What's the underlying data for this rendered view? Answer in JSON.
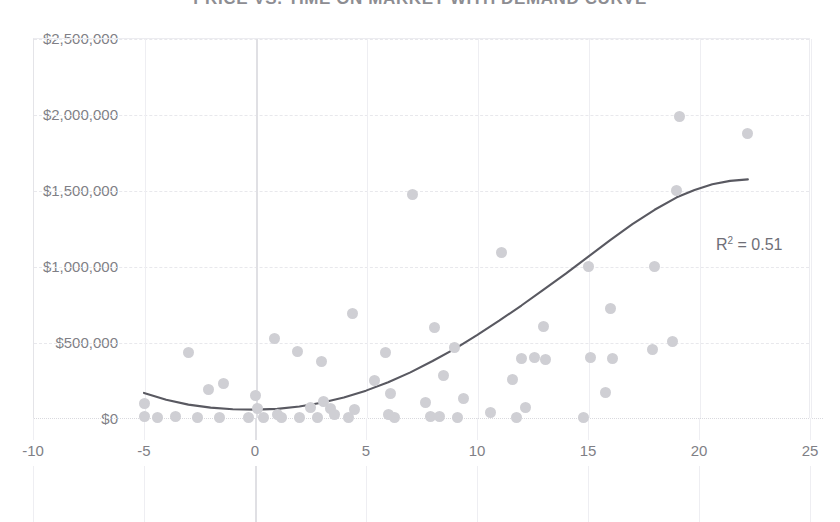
{
  "chart_data": {
    "type": "scatter",
    "title": "PRICE VS. TIME ON MARKET WITH DEMAND CURVE",
    "xlabel": "",
    "ylabel": "",
    "xlim": [
      -10,
      25
    ],
    "ylim": [
      0,
      2500000
    ],
    "x_ticks": [
      "-10",
      "-5",
      "0",
      "5",
      "10",
      "15",
      "20",
      "25"
    ],
    "x_tick_values": [
      -10,
      -5,
      0,
      5,
      10,
      15,
      20,
      25
    ],
    "y_ticks": [
      "$0",
      "$500,000",
      "$1,000,000",
      "$1,500,000",
      "$2,000,000",
      "$2,500,000"
    ],
    "y_tick_values": [
      0,
      500000,
      1000000,
      1500000,
      2000000,
      2500000
    ],
    "grid": true,
    "legend": false,
    "point_color": "#cfcfd4",
    "trendline_color": "#595961",
    "label_color": "#7f7f86",
    "gridline_color": "#e8e8ec",
    "background_color": "#ffffff",
    "annotations": [
      {
        "name": "r-squared",
        "text": "R² = 0.51",
        "value": 0.51,
        "x": 20.8,
        "y": 1120000
      }
    ],
    "points": [
      {
        "x": -5.0,
        "y": 95000
      },
      {
        "x": -5.0,
        "y": 10000
      },
      {
        "x": -4.4,
        "y": 5000
      },
      {
        "x": -3.6,
        "y": 10000
      },
      {
        "x": -3.0,
        "y": 430000
      },
      {
        "x": -2.6,
        "y": 5000
      },
      {
        "x": -2.1,
        "y": 185000
      },
      {
        "x": -1.6,
        "y": 5000
      },
      {
        "x": -1.4,
        "y": 225000
      },
      {
        "x": -0.3,
        "y": 5000
      },
      {
        "x": 0.0,
        "y": 150000
      },
      {
        "x": 0.1,
        "y": 60000
      },
      {
        "x": 0.4,
        "y": 5000
      },
      {
        "x": 0.9,
        "y": 525000
      },
      {
        "x": 1.0,
        "y": 20000
      },
      {
        "x": 1.2,
        "y": 5000
      },
      {
        "x": 1.9,
        "y": 435000
      },
      {
        "x": 2.0,
        "y": 5000
      },
      {
        "x": 2.5,
        "y": 70000
      },
      {
        "x": 2.8,
        "y": 5000
      },
      {
        "x": 3.0,
        "y": 370000
      },
      {
        "x": 3.1,
        "y": 110000
      },
      {
        "x": 3.4,
        "y": 60000
      },
      {
        "x": 3.6,
        "y": 20000
      },
      {
        "x": 4.2,
        "y": 5000
      },
      {
        "x": 4.4,
        "y": 690000
      },
      {
        "x": 4.5,
        "y": 55000
      },
      {
        "x": 5.4,
        "y": 250000
      },
      {
        "x": 5.9,
        "y": 430000
      },
      {
        "x": 6.0,
        "y": 20000
      },
      {
        "x": 6.1,
        "y": 160000
      },
      {
        "x": 6.3,
        "y": 5000
      },
      {
        "x": 7.1,
        "y": 1470000
      },
      {
        "x": 7.7,
        "y": 100000
      },
      {
        "x": 7.9,
        "y": 10000
      },
      {
        "x": 8.1,
        "y": 595000
      },
      {
        "x": 8.3,
        "y": 10000
      },
      {
        "x": 8.5,
        "y": 280000
      },
      {
        "x": 9.0,
        "y": 465000
      },
      {
        "x": 9.1,
        "y": 5000
      },
      {
        "x": 9.4,
        "y": 130000
      },
      {
        "x": 10.6,
        "y": 35000
      },
      {
        "x": 11.1,
        "y": 1090000
      },
      {
        "x": 11.6,
        "y": 255000
      },
      {
        "x": 11.8,
        "y": 5000
      },
      {
        "x": 12.0,
        "y": 390000
      },
      {
        "x": 12.2,
        "y": 70000
      },
      {
        "x": 12.6,
        "y": 395000
      },
      {
        "x": 13.0,
        "y": 600000
      },
      {
        "x": 13.1,
        "y": 385000
      },
      {
        "x": 14.8,
        "y": 5000
      },
      {
        "x": 15.0,
        "y": 1000000
      },
      {
        "x": 15.1,
        "y": 395000
      },
      {
        "x": 15.8,
        "y": 165000
      },
      {
        "x": 16.0,
        "y": 720000
      },
      {
        "x": 16.1,
        "y": 390000
      },
      {
        "x": 17.9,
        "y": 450000
      },
      {
        "x": 18.0,
        "y": 995000
      },
      {
        "x": 18.8,
        "y": 505000
      },
      {
        "x": 19.0,
        "y": 1500000
      },
      {
        "x": 19.1,
        "y": 1985000
      },
      {
        "x": 22.2,
        "y": 1870000
      }
    ],
    "trendline": {
      "type": "polynomial",
      "degree": 2,
      "x_start": -5.0,
      "x_end": 22.2,
      "points": [
        {
          "x": -5.0,
          "y": 165000
        },
        {
          "x": -4.0,
          "y": 120000
        },
        {
          "x": -3.0,
          "y": 88000
        },
        {
          "x": -2.0,
          "y": 68000
        },
        {
          "x": -1.0,
          "y": 58000
        },
        {
          "x": 0.0,
          "y": 55000
        },
        {
          "x": 1.0,
          "y": 60000
        },
        {
          "x": 2.0,
          "y": 76000
        },
        {
          "x": 3.0,
          "y": 100000
        },
        {
          "x": 4.0,
          "y": 135000
        },
        {
          "x": 5.0,
          "y": 180000
        },
        {
          "x": 6.0,
          "y": 235000
        },
        {
          "x": 7.0,
          "y": 300000
        },
        {
          "x": 8.0,
          "y": 375000
        },
        {
          "x": 9.0,
          "y": 455000
        },
        {
          "x": 10.0,
          "y": 545000
        },
        {
          "x": 11.0,
          "y": 640000
        },
        {
          "x": 12.0,
          "y": 740000
        },
        {
          "x": 13.0,
          "y": 845000
        },
        {
          "x": 14.0,
          "y": 950000
        },
        {
          "x": 15.0,
          "y": 1060000
        },
        {
          "x": 16.0,
          "y": 1170000
        },
        {
          "x": 17.0,
          "y": 1275000
        },
        {
          "x": 18.0,
          "y": 1370000
        },
        {
          "x": 19.0,
          "y": 1452000
        },
        {
          "x": 19.8,
          "y": 1500000
        },
        {
          "x": 20.6,
          "y": 1538000
        },
        {
          "x": 21.4,
          "y": 1560000
        },
        {
          "x": 22.2,
          "y": 1570000
        }
      ]
    }
  }
}
